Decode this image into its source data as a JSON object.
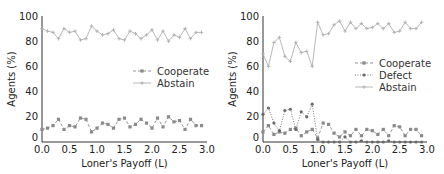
{
  "chart_data": [
    {
      "type": "line",
      "title": "",
      "xlabel": "Loner's Payoff (L)",
      "ylabel": "Agents (%)",
      "xlim": [
        0.0,
        3.0
      ],
      "ylim": [
        0,
        100
      ],
      "xticks": [
        "0.0",
        "0.5",
        "1.0",
        "1.5",
        "2.0",
        "2.5",
        "3.0"
      ],
      "yticks": [
        "0",
        "20",
        "40",
        "60",
        "80",
        "100"
      ],
      "grid": false,
      "legend_position": "center right",
      "x": [
        0.0,
        0.1,
        0.2,
        0.3,
        0.4,
        0.5,
        0.6,
        0.7,
        0.8,
        0.9,
        1.0,
        1.1,
        1.2,
        1.3,
        1.4,
        1.5,
        1.6,
        1.7,
        1.8,
        1.9,
        2.0,
        2.1,
        2.2,
        2.3,
        2.4,
        2.5,
        2.6,
        2.7,
        2.8,
        2.9
      ],
      "series": [
        {
          "name": "Cooperate",
          "marker": "square",
          "linestyle": "dashed",
          "values": [
            10,
            11,
            13,
            18,
            10,
            13,
            12,
            19,
            18,
            8,
            11,
            15,
            14,
            11,
            18,
            19,
            12,
            14,
            18,
            15,
            11,
            19,
            12,
            20,
            16,
            17,
            10,
            18,
            13,
            13
          ]
        },
        {
          "name": "Abstain",
          "marker": "plus",
          "linestyle": "solid",
          "values": [
            90,
            88,
            87,
            82,
            90,
            87,
            88,
            81,
            82,
            92,
            88,
            85,
            86,
            89,
            82,
            81,
            88,
            86,
            82,
            85,
            89,
            81,
            88,
            80,
            85,
            83,
            90,
            82,
            87,
            87
          ]
        }
      ]
    },
    {
      "type": "line",
      "title": "",
      "xlabel": "Loner's Payoff (L)",
      "ylabel": "Agents (%)",
      "xlim": [
        0.0,
        3.0
      ],
      "ylim": [
        0,
        100
      ],
      "xticks": [
        "0.0",
        "0.5",
        "1.0",
        "1.5",
        "2.0",
        "2.5",
        "3.0"
      ],
      "yticks": [
        "0",
        "20",
        "40",
        "60",
        "80",
        "100"
      ],
      "grid": false,
      "legend_position": "center right",
      "x": [
        0.0,
        0.1,
        0.2,
        0.3,
        0.4,
        0.5,
        0.6,
        0.7,
        0.8,
        0.9,
        1.0,
        1.1,
        1.2,
        1.3,
        1.4,
        1.5,
        1.6,
        1.7,
        1.8,
        1.9,
        2.0,
        2.1,
        2.2,
        2.3,
        2.4,
        2.5,
        2.6,
        2.7,
        2.8,
        2.9
      ],
      "series": [
        {
          "name": "Cooperate",
          "marker": "square",
          "linestyle": "dashed",
          "values": [
            8,
            13,
            6,
            8,
            7,
            10,
            11,
            5,
            8,
            10,
            3,
            15,
            14,
            7,
            4,
            8,
            5,
            10,
            5,
            10,
            9,
            6,
            10,
            5,
            13,
            12,
            5,
            10,
            10,
            5
          ]
        },
        {
          "name": "Defect",
          "marker": "circle",
          "linestyle": "dotted",
          "values": [
            22,
            27,
            15,
            9,
            25,
            26,
            10,
            24,
            20,
            30,
            2,
            0,
            0,
            0,
            0,
            4,
            0,
            0,
            1,
            0,
            0,
            0,
            0,
            1,
            0,
            0,
            0,
            0,
            0,
            0
          ]
        },
        {
          "name": "Abstain",
          "marker": "plus",
          "linestyle": "solid",
          "values": [
            70,
            60,
            79,
            83,
            68,
            64,
            79,
            71,
            72,
            60,
            95,
            85,
            86,
            93,
            96,
            88,
            95,
            90,
            94,
            90,
            91,
            94,
            90,
            94,
            87,
            88,
            95,
            90,
            90,
            95
          ]
        }
      ]
    }
  ],
  "legend": {
    "left": [
      "Cooperate",
      "Abstain"
    ],
    "right": [
      "Cooperate",
      "Defect",
      "Abstain"
    ]
  },
  "colors": {
    "cooperate": "#8a8a8a",
    "defect": "#6a6a6a",
    "abstain": "#b0b0b0",
    "axis": "#333333"
  }
}
